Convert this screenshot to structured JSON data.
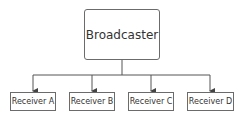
{
  "diagram": {
    "root": {
      "label": "Broadcaster"
    },
    "children": [
      {
        "label": "Receiver A"
      },
      {
        "label": "Receiver B"
      },
      {
        "label": "Receiver C"
      },
      {
        "label": "Receiver D"
      }
    ],
    "colors": {
      "line": "#555555",
      "box_border": "#6b6b6b",
      "text": "#333333"
    }
  }
}
